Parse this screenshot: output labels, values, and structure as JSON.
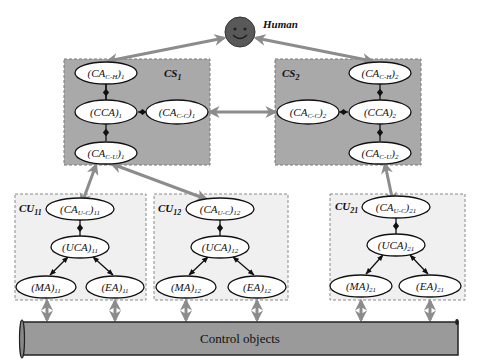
{
  "human": {
    "label": "Human"
  },
  "cs1": {
    "label": "CS",
    "sub": "1",
    "nodes": {
      "cah": {
        "base": "(CA",
        "sub": "C-H",
        "close": ")",
        "idx": "1"
      },
      "cca": {
        "base": "(CCA)",
        "sub": "",
        "close": "",
        "idx": "1"
      },
      "cac": {
        "base": "(CA",
        "sub": "C-C",
        "close": ")",
        "idx": "1"
      },
      "cau": {
        "base": "(CA",
        "sub": "C-U",
        "close": ")",
        "idx": "1"
      }
    }
  },
  "cs2": {
    "label": "CS",
    "sub": "2",
    "nodes": {
      "cah": {
        "base": "(CA",
        "sub": "C-H",
        "close": ")",
        "idx": "2"
      },
      "cca": {
        "base": "(CCA)",
        "sub": "",
        "close": "",
        "idx": "2"
      },
      "cac": {
        "base": "(CA",
        "sub": "C-C",
        "close": ")",
        "idx": "2"
      },
      "cau": {
        "base": "(CA",
        "sub": "C-U",
        "close": ")",
        "idx": "2"
      }
    }
  },
  "cu11": {
    "label": "CU",
    "sub": "11",
    "nodes": {
      "cauc": {
        "base": "(CA",
        "sub": "U-C",
        "close": ")",
        "idx": "11"
      },
      "uca": {
        "base": "(UCA)",
        "idx": "11"
      },
      "ma": {
        "base": "(MA)",
        "idx": "11"
      },
      "ea": {
        "base": "(EA)",
        "idx": "11"
      }
    }
  },
  "cu12": {
    "label": "CU",
    "sub": "12",
    "nodes": {
      "cauc": {
        "base": "(CA",
        "sub": "U-C",
        "close": ")",
        "idx": "12"
      },
      "uca": {
        "base": "(UCA)",
        "idx": "12"
      },
      "ma": {
        "base": "(MA)",
        "idx": "12"
      },
      "ea": {
        "base": "(EA)",
        "idx": "12"
      }
    }
  },
  "cu21": {
    "label": "CU",
    "sub": "21",
    "nodes": {
      "cauc": {
        "base": "(CA",
        "sub": "U-C",
        "close": ")",
        "idx": "21"
      },
      "uca": {
        "base": "(UCA)",
        "idx": "21"
      },
      "ma": {
        "base": "(MA)",
        "idx": "21"
      },
      "ea": {
        "base": "(EA)",
        "idx": "21"
      }
    }
  },
  "control": {
    "label": "Control objects"
  },
  "colors": {
    "cs_fill": "#a9a9a9",
    "cu_fill": "#f0f0f0",
    "arrow": "#8c8c8c",
    "human_face": "#595959",
    "bar_fill": "#9a9a9a"
  }
}
